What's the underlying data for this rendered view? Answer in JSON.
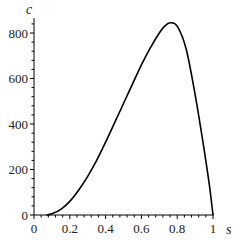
{
  "chart_data": {
    "type": "line",
    "title": "",
    "xlabel": "s",
    "ylabel": "c",
    "xlim": [
      0,
      1
    ],
    "ylim": [
      0,
      870
    ],
    "grid": false,
    "legend": null,
    "x_ticks": [
      "0",
      "0.2",
      "0.4",
      "0.6",
      "0.8",
      "1"
    ],
    "y_ticks": [
      "0",
      "200",
      "400",
      "600",
      "800"
    ],
    "series": [
      {
        "name": "c(s)",
        "color": "#000000",
        "x": [
          0.07,
          0.1,
          0.15,
          0.2,
          0.25,
          0.3,
          0.35,
          0.4,
          0.45,
          0.5,
          0.55,
          0.6,
          0.65,
          0.7,
          0.73,
          0.76,
          0.8,
          0.85,
          0.9,
          0.95,
          0.98,
          1.0
        ],
        "y": [
          0,
          5,
          25,
          60,
          110,
          170,
          240,
          320,
          405,
          490,
          575,
          660,
          735,
          800,
          830,
          845,
          830,
          730,
          530,
          290,
          130,
          0
        ]
      }
    ]
  }
}
